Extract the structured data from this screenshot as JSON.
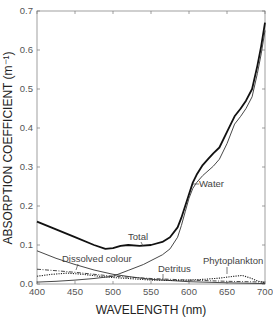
{
  "chart_data": {
    "type": "line",
    "title": "",
    "xlabel": "WAVELENGTH (nm)",
    "ylabel": "ABSORPTION COEFFICIENT (m⁻¹)",
    "xlim": [
      400,
      700
    ],
    "ylim": [
      0.0,
      0.7
    ],
    "xticks": [
      400,
      450,
      500,
      550,
      600,
      650,
      700
    ],
    "xtick_labels": [
      "400",
      "450",
      "500",
      "550",
      "600",
      "650",
      "700"
    ],
    "yticks": [
      0.0,
      0.1,
      0.2,
      0.3,
      0.4,
      0.5,
      0.6,
      0.7
    ],
    "ytick_labels": [
      "0.0",
      "0.1",
      "0.2",
      "0.3",
      "0.4",
      "0.5",
      "0.6",
      "0.7"
    ],
    "grid": false,
    "legend": "inline annotations",
    "series": [
      {
        "name": "Total",
        "style": "solid-thick",
        "x": [
          400,
          425,
          450,
          475,
          490,
          500,
          510,
          520,
          535,
          550,
          565,
          575,
          585,
          590,
          595,
          600,
          605,
          610,
          618,
          625,
          632,
          640,
          650,
          660,
          668,
          675,
          683,
          690,
          695,
          700
        ],
        "y": [
          0.16,
          0.14,
          0.12,
          0.1,
          0.09,
          0.092,
          0.098,
          0.1,
          0.098,
          0.1,
          0.108,
          0.12,
          0.145,
          0.17,
          0.2,
          0.23,
          0.26,
          0.28,
          0.305,
          0.32,
          0.335,
          0.35,
          0.39,
          0.43,
          0.45,
          0.47,
          0.5,
          0.56,
          0.61,
          0.67
        ]
      },
      {
        "name": "Water",
        "style": "solid-thin",
        "x": [
          400,
          425,
          450,
          475,
          500,
          520,
          540,
          550,
          565,
          575,
          585,
          590,
          595,
          600,
          605,
          610,
          618,
          625,
          632,
          640,
          650,
          660,
          668,
          675,
          683,
          690,
          695,
          700
        ],
        "y": [
          0.005,
          0.007,
          0.01,
          0.014,
          0.02,
          0.035,
          0.05,
          0.06,
          0.075,
          0.09,
          0.12,
          0.15,
          0.185,
          0.22,
          0.245,
          0.26,
          0.278,
          0.29,
          0.302,
          0.32,
          0.36,
          0.41,
          0.43,
          0.45,
          0.48,
          0.54,
          0.59,
          0.65
        ]
      },
      {
        "name": "Dissolved colour",
        "style": "solid-thin",
        "x": [
          400,
          425,
          450,
          475,
          500,
          525,
          550,
          575,
          600,
          650,
          700
        ],
        "y": [
          0.085,
          0.066,
          0.05,
          0.036,
          0.025,
          0.018,
          0.012,
          0.009,
          0.006,
          0.003,
          0.001
        ]
      },
      {
        "name": "Detritus",
        "style": "dash-dot",
        "x": [
          400,
          425,
          450,
          475,
          500,
          550,
          600,
          650,
          700
        ],
        "y": [
          0.038,
          0.034,
          0.03,
          0.025,
          0.02,
          0.014,
          0.01,
          0.007,
          0.005
        ]
      },
      {
        "name": "Phytoplankton",
        "style": "dotted",
        "x": [
          400,
          420,
          440,
          460,
          490,
          520,
          550,
          580,
          600,
          620,
          640,
          660,
          670,
          680,
          690,
          700
        ],
        "y": [
          0.02,
          0.025,
          0.028,
          0.025,
          0.018,
          0.014,
          0.01,
          0.009,
          0.01,
          0.012,
          0.015,
          0.02,
          0.022,
          0.016,
          0.008,
          0.003
        ]
      }
    ],
    "annotations": [
      {
        "text": "Total",
        "at_x": 530,
        "at_y": 0.1
      },
      {
        "text": "Water",
        "at_x": 600,
        "at_y": 0.23
      },
      {
        "text": "Dissolved colour",
        "at_x": 470,
        "at_y": 0.04
      },
      {
        "text": "Detritus",
        "at_x": 560,
        "at_y": 0.014
      },
      {
        "text": "Phytoplankton",
        "at_x": 665,
        "at_y": 0.022
      }
    ]
  },
  "labels": {
    "xlabel": "WAVELENGTH (nm)",
    "ylabel": "ABSORPTION COEFFICIENT (m⁻¹)",
    "total": "Total",
    "water": "Water",
    "dissolved": "Dissolved colour",
    "detritus": "Detritus",
    "phyto": "Phytoplankton"
  }
}
